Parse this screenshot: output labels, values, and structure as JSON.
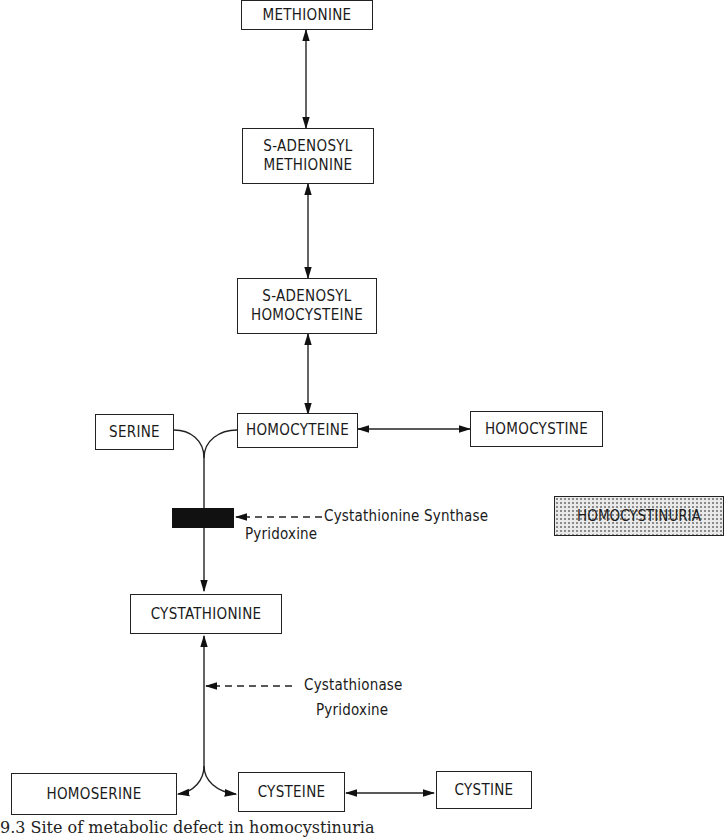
{
  "nodes": {
    "methionine": "METHIONINE",
    "sam": "S-ADENOSYL\nMETHIONINE",
    "sah": "S-ADENOSYL\nHOMOCYSTEINE",
    "serine": "SERINE",
    "homocyteine": "HOMOCYTEINE",
    "homocystine": "HOMOCYSTINE",
    "cystathionine": "CYSTATHIONINE",
    "homoserine": "HOMOSERINE",
    "cysteine": "CYSTEINE",
    "cystine": "CYSTINE"
  },
  "disease": {
    "label": "HOMOCYSTINURIA"
  },
  "enzymes": {
    "synthase_name": "Cystathionine Synthase",
    "synthase_cofactor": "Pyridoxine",
    "cystathionase_name": "Cystathionase",
    "cystathionase_cofactor": "Pyridoxine"
  },
  "caption": "9.3  Site of metabolic defect in homocystinuria"
}
